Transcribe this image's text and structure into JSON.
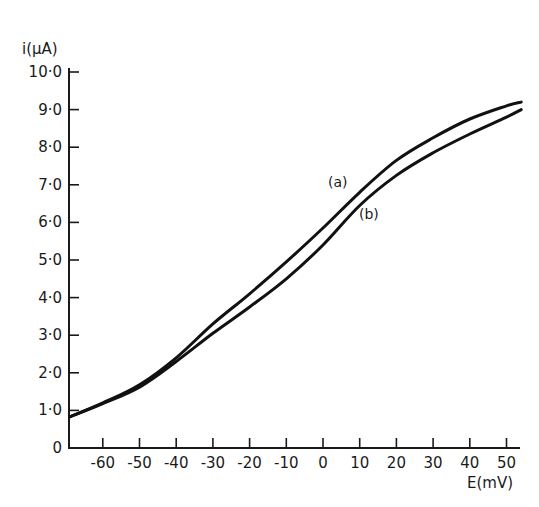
{
  "chart_data": {
    "type": "line",
    "title": "",
    "xlabel": "E(mV)",
    "ylabel": "i(μA)",
    "xlim": [
      -69,
      55
    ],
    "ylim": [
      0,
      10
    ],
    "grid": false,
    "legend": "inline labels",
    "x_ticks": [
      -60,
      -50,
      -40,
      -30,
      -20,
      -10,
      0,
      10,
      20,
      30,
      40,
      50
    ],
    "x_tick_labels": [
      "-60",
      "-50",
      "-40",
      "-30",
      "-20",
      "-10",
      "0",
      "10",
      "20",
      "30",
      "40",
      "50"
    ],
    "y_ticks": [
      0,
      1,
      2,
      3,
      4,
      5,
      6,
      7,
      8,
      9,
      10
    ],
    "y_tick_labels": [
      "0",
      "1·0",
      "2·0",
      "3·0",
      "4·0",
      "5·0",
      "6·0",
      "7·0",
      "8·0",
      "9·0",
      "10·0"
    ],
    "x": [
      -69,
      -60,
      -50,
      -40,
      -30,
      -20,
      -10,
      0,
      10,
      20,
      30,
      40,
      50,
      54
    ],
    "series": [
      {
        "name": "(a)",
        "values": [
          0.83,
          1.2,
          1.68,
          2.4,
          3.3,
          4.1,
          4.95,
          5.85,
          6.8,
          7.65,
          8.25,
          8.75,
          9.1,
          9.2
        ]
      },
      {
        "name": "(b)",
        "values": [
          0.83,
          1.18,
          1.62,
          2.3,
          3.05,
          3.75,
          4.5,
          5.4,
          6.45,
          7.25,
          7.85,
          8.35,
          8.8,
          9.0
        ]
      }
    ],
    "annotations": [
      {
        "text": "(a)",
        "x": 4,
        "y": 6.95
      },
      {
        "text": "(b)",
        "x": 12.5,
        "y": 6.1
      }
    ]
  },
  "colors": {
    "ink": "#111111",
    "background": "#ffffff"
  }
}
